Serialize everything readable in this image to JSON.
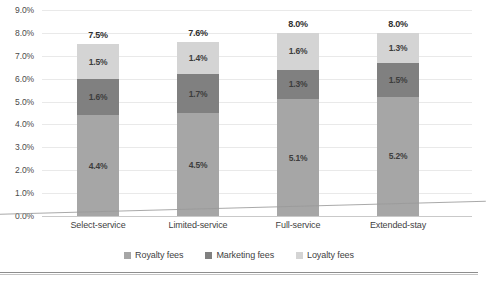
{
  "chart_data": {
    "type": "bar",
    "subtype": "stacked-bar",
    "title": "",
    "xlabel": "",
    "ylabel": "",
    "ylim": [
      0,
      9.0
    ],
    "ytick_step": 1.0,
    "ytick_labels": [
      "9.0%",
      "8.0%",
      "7.0%",
      "6.0%",
      "5.0%",
      "4.0%",
      "3.0%",
      "2.0%",
      "1.0%",
      "0.0%"
    ],
    "ytick_values": [
      9.0,
      8.0,
      7.0,
      6.0,
      5.0,
      4.0,
      3.0,
      2.0,
      1.0,
      0.0
    ],
    "grid": true,
    "grid_axis": "y",
    "legend_position": "bottom",
    "categories": [
      "Select-service",
      "Limited-service",
      "Full-service",
      "Extended-stay"
    ],
    "series": [
      {
        "name": "Royalty fees",
        "color": "#a6a6a6",
        "values": [
          4.4,
          4.5,
          5.1,
          5.2
        ],
        "labels": [
          "4.4%",
          "4.5%",
          "5.1%",
          "5.2%"
        ]
      },
      {
        "name": "Marketing fees",
        "color": "#808080",
        "values": [
          1.6,
          1.7,
          1.3,
          1.5
        ],
        "labels": [
          "1.6%",
          "1.7%",
          "1.3%",
          "1.5%"
        ]
      },
      {
        "name": "Loyalty fees",
        "color": "#d4d4d4",
        "values": [
          1.5,
          1.4,
          1.6,
          1.3
        ],
        "labels": [
          "1.5%",
          "1.4%",
          "1.6%",
          "1.3%"
        ]
      }
    ],
    "totals": [
      7.5,
      7.6,
      8.0,
      8.0
    ],
    "total_labels": [
      "7.5%",
      "7.6%",
      "8.0%",
      "8.0%"
    ]
  },
  "legend": {
    "items": [
      {
        "label": "Royalty fees",
        "color": "#a6a6a6"
      },
      {
        "label": "Marketing fees",
        "color": "#808080"
      },
      {
        "label": "Loyalty fees",
        "color": "#d4d4d4"
      }
    ]
  },
  "artifacts": {
    "cut_text": ""
  }
}
